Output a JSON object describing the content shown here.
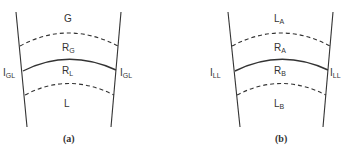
{
  "panels": [
    {
      "caption": "(a)",
      "top_region": {
        "main": "G",
        "sub": ""
      },
      "upper_mid_region": {
        "main": "R",
        "sub": "G"
      },
      "lower_mid_region": {
        "main": "R",
        "sub": "L"
      },
      "bottom_region": {
        "main": "L",
        "sub": ""
      },
      "left_interface": {
        "main": "I",
        "sub": "GL"
      },
      "right_interface": {
        "main": "I",
        "sub": "GL"
      }
    },
    {
      "caption": "(b)",
      "top_region": {
        "main": "L",
        "sub": "A"
      },
      "upper_mid_region": {
        "main": "R",
        "sub": "A"
      },
      "lower_mid_region": {
        "main": "R",
        "sub": "B"
      },
      "bottom_region": {
        "main": "L",
        "sub": "B"
      },
      "left_interface": {
        "main": "I",
        "sub": "LL"
      },
      "right_interface": {
        "main": "I",
        "sub": "LL"
      }
    }
  ],
  "colors": {
    "line": "#333333"
  }
}
